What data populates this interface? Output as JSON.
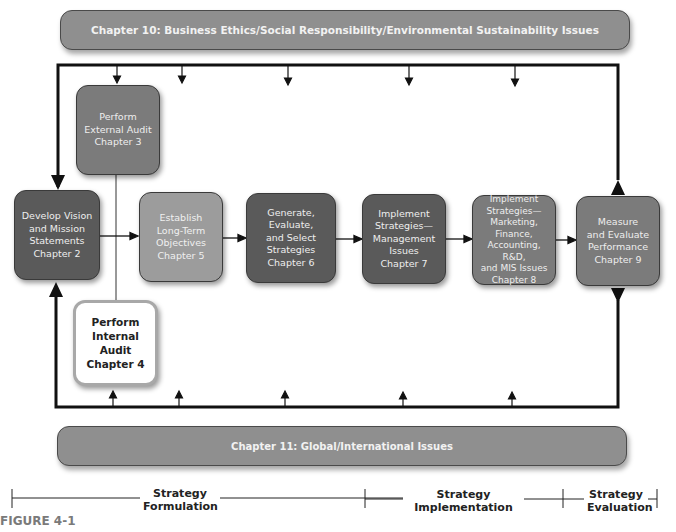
{
  "banners": {
    "top": "Chapter 10: Business Ethics/Social Responsibility/Environmental Sustainability Issues",
    "bottom": "Chapter 11:  Global/International Issues"
  },
  "boxes": {
    "external_audit": "Perform\nExternal Audit\nChapter 3",
    "vision": "Develop Vision\nand Mission\nStatements\nChapter 2",
    "objectives": "Establish\nLong-Term\nObjectives\nChapter 5",
    "strategies": "Generate,\nEvaluate,\nand Select\nStrategies\nChapter 6",
    "implement_mgmt": "Implement\nStrategies—\nManagement\nIssues\nChapter 7",
    "implement_mktg": "Implement\nStrategies—\nMarketing,\nFinance,\nAccounting, R&D,\nand MIS Issues\nChapter 8",
    "measure": "Measure\nand Evaluate\nPerformance\nChapter 9",
    "internal_audit": "Perform\nInternal Audit\nChapter 4"
  },
  "phases": {
    "formulation": "Strategy\nFormulation",
    "implementation": "Strategy\nImplementation",
    "evaluation": "Strategy\nEvaluation"
  },
  "figure_label": "FIGURE 4-1",
  "colors": {
    "dark_box": "#5a5a5a",
    "mid_box": "#7b7b7b",
    "light_box": "#9c9c9c",
    "banner": "#8f8f8f",
    "figure_label": "#7a7a7a"
  }
}
